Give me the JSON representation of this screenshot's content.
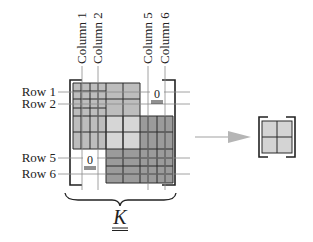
{
  "diagram": {
    "column_labels": [
      {
        "text": "Column 1",
        "x": 82
      },
      {
        "text": "Column 2",
        "x": 98
      },
      {
        "text": "Column 5",
        "x": 148
      },
      {
        "text": "Column 6",
        "x": 165
      }
    ],
    "row_labels": [
      {
        "text": "Row 1",
        "y": 92
      },
      {
        "text": "Row 2",
        "y": 104
      },
      {
        "text": "Row 5",
        "y": 158
      },
      {
        "text": "Row 6",
        "y": 174
      }
    ],
    "zero_top_right": "0",
    "zero_bottom_left": "0",
    "matrix_symbol": "K",
    "colors": {
      "block_light": "#bdbdbd",
      "block_overlap": "#d6d6d6",
      "block_dark": "#9b9b9b",
      "grid_line": "#2a2a2a",
      "guide_line": "#8a8a8a",
      "arrow": "#b5b5b5",
      "small_cell": "#d4d4d4"
    }
  }
}
